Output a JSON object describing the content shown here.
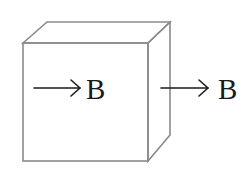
{
  "diagram": {
    "type": "cube-with-field-arrows",
    "colors": {
      "edge": "#8a8a8a",
      "arrow": "#1a1a1a",
      "background": "#ffffff"
    },
    "inside_arrow": {
      "label": "B",
      "direction": "right"
    },
    "outside_arrow": {
      "label": "B",
      "direction": "right"
    }
  }
}
